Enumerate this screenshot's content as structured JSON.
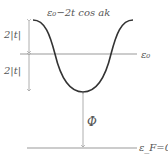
{
  "labels": {
    "curve": "ε₀−2t cos ak",
    "eps0": "ε₀",
    "upper_gap": "2|t|",
    "lower_gap": "2|t|",
    "phi": "Φ",
    "fermi": "ε_F=0"
  },
  "colors": {
    "curve": "#333333",
    "lines": "#999999",
    "text": "#555555"
  }
}
